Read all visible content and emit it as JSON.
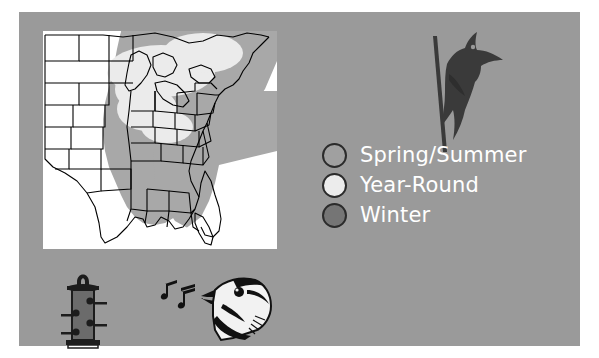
{
  "figure": {
    "background_color": "#ffffff",
    "panel_color": "#9a9a9a"
  },
  "map": {
    "name": "eastern-united-states-range-map",
    "background_color": "#ffffff",
    "state_outline_color": "#000000",
    "regions": [
      {
        "season": "Spring/Summer",
        "fill": "#a8a8a8"
      },
      {
        "season": "Year-Round",
        "fill": "#e8e8e8"
      },
      {
        "season": "Winter",
        "fill": "#7d7d7d"
      }
    ]
  },
  "legend": {
    "items": [
      {
        "label": "Spring/Summer",
        "color": "#a0a0a0",
        "outline": "#2b2b2b"
      },
      {
        "label": "Year-Round",
        "color": "#ececec",
        "outline": "#2b2b2b"
      },
      {
        "label": "Winter",
        "color": "#757575",
        "outline": "#2b2b2b"
      }
    ],
    "text_color": "#ffffff"
  },
  "illustrations": {
    "woodpecker": {
      "name": "pileated-woodpecker-silhouette",
      "color": "#3a3a3a"
    },
    "feeder": {
      "name": "tube-bird-feeder",
      "color": "#1c1c1c"
    },
    "singing_bird": {
      "name": "singing-bird-head",
      "color": "#111111",
      "notes_count": 2
    }
  }
}
